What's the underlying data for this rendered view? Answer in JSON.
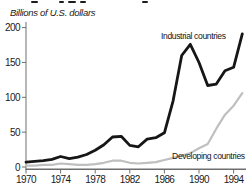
{
  "figure": {
    "cropped_title_visible": true,
    "y_axis_title": "Billions of U.S. dollars"
  },
  "chart_data": {
    "type": "line",
    "title": "",
    "ylabel": "Billions of U.S. dollars",
    "xlabel": "",
    "ylim": [
      0,
      200
    ],
    "yticks": [
      0,
      50,
      100,
      150,
      200
    ],
    "xticks": [
      1970,
      1974,
      1978,
      1982,
      1986,
      1990,
      1994
    ],
    "xlim": [
      1970,
      1995
    ],
    "grid": false,
    "legend_position": "inline-annotations",
    "axis_color": "#6e6e6e",
    "x": [
      1970,
      1971,
      1972,
      1973,
      1974,
      1975,
      1976,
      1977,
      1978,
      1979,
      1980,
      1981,
      1982,
      1983,
      1984,
      1985,
      1986,
      1987,
      1988,
      1989,
      1990,
      1991,
      1992,
      1993,
      1994,
      1995
    ],
    "series": [
      {
        "name": "Industrial countries",
        "color": "#161616",
        "values": [
          7,
          8,
          9,
          11,
          15,
          12,
          14,
          18,
          24,
          32,
          43,
          44,
          31,
          29,
          40,
          42,
          49,
          95,
          160,
          176,
          150,
          117,
          119,
          138,
          143,
          191
        ]
      },
      {
        "name": "Developing countries",
        "color": "#bfbfbf",
        "values": [
          2,
          2,
          3,
          3,
          5,
          4,
          3,
          3,
          4,
          6,
          9,
          9,
          6,
          5,
          6,
          7,
          10,
          13,
          16,
          20,
          27,
          33,
          55,
          75,
          88,
          106
        ]
      }
    ]
  }
}
